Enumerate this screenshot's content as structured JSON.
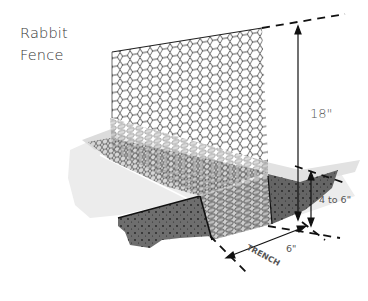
{
  "title": {
    "line1": "Rabbit",
    "line2": "Fence"
  },
  "labels": {
    "height": "18\"",
    "depth": "4 to 6\"",
    "trench": "TRENCH",
    "width": "6\""
  },
  "colors": {
    "mesh": "#333333",
    "soil": "#6e6e6e",
    "soil_dark": "#4a4a4a",
    "ground_light": "#e6e6e6",
    "line": "#111111"
  }
}
